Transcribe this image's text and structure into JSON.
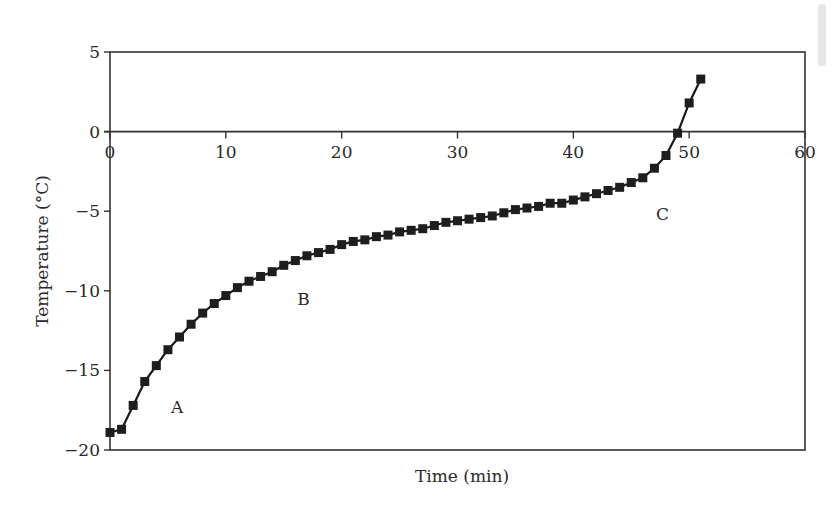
{
  "chart_data": {
    "type": "line",
    "title": "",
    "xlabel": "Time (min)",
    "ylabel": "Temperature (°C)",
    "xlim": [
      0,
      60
    ],
    "ylim": [
      -20,
      5
    ],
    "x_ticks": [
      0,
      10,
      20,
      30,
      40,
      50,
      60
    ],
    "y_ticks": [
      5,
      0,
      -5,
      -10,
      -15,
      -20
    ],
    "x_tick_labels": [
      "0",
      "10",
      "20",
      "30",
      "40",
      "50",
      "60"
    ],
    "y_tick_labels": [
      "5",
      "0",
      "−5",
      "−10",
      "−15",
      "−20"
    ],
    "grid": false,
    "legend": null,
    "x_axis_position": "y=0",
    "marker": "square",
    "series": [
      {
        "name": "Temperature",
        "color": "#1e1e1e",
        "x": [
          0,
          1,
          2,
          3,
          4,
          5,
          6,
          7,
          8,
          9,
          10,
          11,
          12,
          13,
          14,
          15,
          16,
          17,
          18,
          19,
          20,
          21,
          22,
          23,
          24,
          25,
          26,
          27,
          28,
          29,
          30,
          31,
          32,
          33,
          34,
          35,
          36,
          37,
          38,
          39,
          40,
          41,
          42,
          43,
          44,
          45,
          46,
          47,
          48,
          49,
          50,
          51
        ],
        "y": [
          -18.9,
          -18.7,
          -17.2,
          -15.7,
          -14.7,
          -13.7,
          -12.9,
          -12.1,
          -11.4,
          -10.8,
          -10.3,
          -9.8,
          -9.4,
          -9.1,
          -8.8,
          -8.4,
          -8.1,
          -7.8,
          -7.6,
          -7.4,
          -7.1,
          -6.9,
          -6.8,
          -6.6,
          -6.5,
          -6.3,
          -6.2,
          -6.1,
          -5.9,
          -5.7,
          -5.6,
          -5.5,
          -5.4,
          -5.3,
          -5.1,
          -4.9,
          -4.8,
          -4.7,
          -4.5,
          -4.5,
          -4.3,
          -4.1,
          -3.9,
          -3.7,
          -3.5,
          -3.2,
          -2.9,
          -2.3,
          -1.5,
          -0.1,
          1.8,
          3.3
        ]
      }
    ],
    "annotations": [
      {
        "text": "A",
        "x": 5.8,
        "y": -17.3
      },
      {
        "text": "B",
        "x": 16.7,
        "y": -10.5
      },
      {
        "text": "C",
        "x": 47.7,
        "y": -5.2
      }
    ]
  },
  "labels": {
    "xlabel": "Time (min)",
    "ylabel": "Temperature (°C)",
    "annotation_a": "A",
    "annotation_b": "B",
    "annotation_c": "C"
  }
}
